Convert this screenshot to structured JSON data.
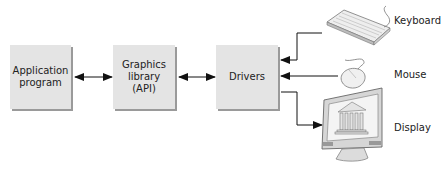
{
  "diagram": {
    "boxes": [
      {
        "id": "application",
        "lines": [
          "Application",
          "program"
        ]
      },
      {
        "id": "graphics",
        "lines": [
          "Graphics",
          "library",
          "(API)"
        ]
      },
      {
        "id": "drivers",
        "lines": [
          "Drivers"
        ]
      }
    ],
    "devices": [
      {
        "id": "keyboard",
        "label": "Keyboard",
        "icon": "keyboard-icon",
        "direction": "input"
      },
      {
        "id": "mouse",
        "label": "Mouse",
        "icon": "mouse-icon",
        "direction": "input"
      },
      {
        "id": "display",
        "label": "Display",
        "icon": "monitor-icon",
        "direction": "output"
      }
    ],
    "connections": [
      {
        "from": "Application program",
        "to": "Graphics library (API)",
        "type": "bidirectional"
      },
      {
        "from": "Graphics library (API)",
        "to": "Drivers",
        "type": "bidirectional"
      },
      {
        "from": "Keyboard",
        "to": "Drivers",
        "type": "directed"
      },
      {
        "from": "Mouse",
        "to": "Drivers",
        "type": "directed"
      },
      {
        "from": "Drivers",
        "to": "Display",
        "type": "directed"
      }
    ],
    "colors": {
      "box_fill": "#e4e4e4",
      "box_shadow": "#9a9a9a",
      "line": "#111111"
    }
  }
}
